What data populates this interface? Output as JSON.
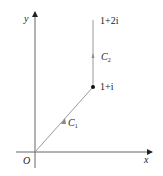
{
  "diagram": {
    "type": "complex-plane-contour",
    "axes": {
      "x_label": "x",
      "y_label": "y",
      "origin_label": "O"
    },
    "points": [
      {
        "label": "1+i",
        "re": 1,
        "im": 1,
        "marked": true
      },
      {
        "label": "1+2i",
        "re": 1,
        "im": 2,
        "marked": false
      }
    ],
    "paths": [
      {
        "name": "C",
        "subscript": "1",
        "from": "O",
        "to": "1+i",
        "direction": "origin to 1+i"
      },
      {
        "name": "C",
        "subscript": "2",
        "from": "1+i",
        "to": "1+2i",
        "direction": "1+i to 1+2i"
      }
    ],
    "colors": {
      "axis": "#333333",
      "path": "#9a9a9a",
      "point": "#111111",
      "text": "#222222"
    }
  }
}
